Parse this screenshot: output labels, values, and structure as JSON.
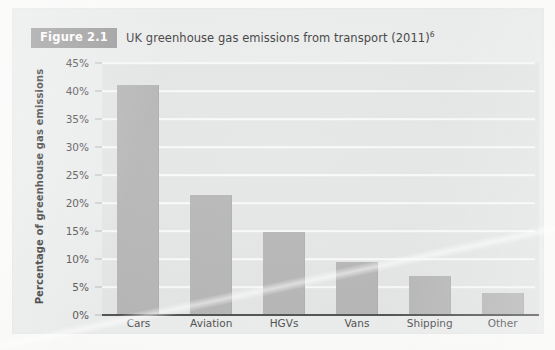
{
  "figure": {
    "badge_label": "Figure 2.1",
    "title": "UK greenhouse gas emissions from transport (2011)",
    "footnote_marker": "6"
  },
  "colors": {
    "bar": "#b4b4b4",
    "plot_background": "#e4e5e5",
    "card_background": "#eceded",
    "gridline": "#fafafa",
    "axis": "#4b4b4b",
    "badge": "#9a9a9a"
  },
  "chart_data": {
    "type": "bar",
    "title": "UK greenhouse gas emissions from transport (2011)",
    "xlabel": "",
    "ylabel": "Percentage of greenhouse gas emissions",
    "categories": [
      "Cars",
      "Aviation",
      "HGVs",
      "Vans",
      "Shipping",
      "Other"
    ],
    "values": [
      41,
      21.5,
      14.8,
      9.4,
      7,
      4
    ],
    "ylim": [
      0,
      45
    ],
    "ytick_values": [
      0,
      5,
      10,
      15,
      20,
      25,
      30,
      35,
      40,
      45
    ],
    "ytick_labels": [
      "0%",
      "5%",
      "10%",
      "15%",
      "20%",
      "25%",
      "30%",
      "35%",
      "40%",
      "45%"
    ],
    "grid": true,
    "legend": false,
    "units": "percent"
  }
}
